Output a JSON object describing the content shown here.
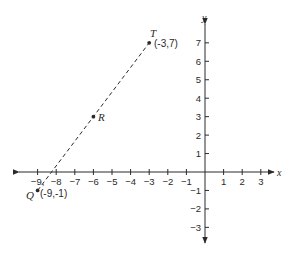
{
  "chart_data": {
    "type": "scatter",
    "title": "",
    "xlabel": "x",
    "ylabel": "y",
    "xlim": [
      -9,
      3
    ],
    "ylim": [
      -3,
      7
    ],
    "grid": false,
    "x_ticks": [
      -9,
      -8,
      -7,
      -6,
      -5,
      -4,
      -3,
      -2,
      -1,
      1,
      2,
      3
    ],
    "y_ticks": [
      -3,
      -2,
      -1,
      1,
      2,
      3,
      4,
      5,
      6,
      7
    ],
    "points": [
      {
        "name": "T",
        "x": -3,
        "y": 7,
        "label": "(-3,7)"
      },
      {
        "name": "R",
        "x": -6,
        "y": 3,
        "label": ""
      },
      {
        "name": "Q",
        "x": -9,
        "y": -1,
        "label": "(-9,-1)"
      }
    ],
    "segments": [
      {
        "from": "Q",
        "to": "T",
        "style": "dashed"
      }
    ]
  },
  "labels": {
    "x_axis": "x",
    "y_axis": "y",
    "point_T": "T",
    "point_T_coord": "(-3,7)",
    "point_R": "R",
    "point_Q": "Q",
    "point_Q_coord": "(-9,-1)"
  },
  "colors": {
    "ink": "#2a2a2a",
    "background": "#ffffff"
  }
}
